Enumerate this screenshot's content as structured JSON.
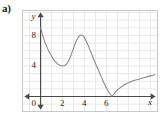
{
  "figure": {
    "part_label": "a)",
    "axis_names": {
      "x": "x",
      "y": "y"
    },
    "origin_label": "0"
  },
  "colors": {
    "grid": "#e9e9e9",
    "axis": "#4a4a4a",
    "curve": "#8a8a8a",
    "frame": "#c9c9c9",
    "text": "#2a2a2a"
  },
  "chart_data": {
    "type": "line",
    "title": "",
    "xlabel": "x",
    "ylabel": "y",
    "xlim": [
      -1.6,
      10.6
    ],
    "ylim": [
      -1.9,
      11.2
    ],
    "grid": true,
    "legend": null,
    "xticks": [
      2,
      4,
      6
    ],
    "xtick_labels": [
      "2",
      "4",
      "6"
    ],
    "yticks": [
      4,
      8
    ],
    "ytick_labels": [
      "4",
      "8"
    ],
    "origin_label": "0",
    "series": [
      {
        "name": "curve",
        "x": [
          0.0,
          0.2,
          0.4,
          0.6,
          0.8,
          1.0,
          1.2,
          1.4,
          1.6,
          1.8,
          2.0,
          2.2,
          2.4,
          2.6,
          2.8,
          3.0,
          3.2,
          3.4,
          3.6,
          3.7,
          3.9,
          4.1,
          4.3,
          4.5,
          4.8,
          5.1,
          5.4,
          5.7,
          6.0,
          6.2,
          6.4,
          6.5,
          6.7,
          6.9,
          7.2,
          7.6,
          8.0,
          8.5,
          9.0,
          9.5,
          10.0,
          10.4
        ],
        "y": [
          9.0,
          8.0,
          7.1,
          6.4,
          5.8,
          5.3,
          4.8,
          4.5,
          4.2,
          4.05,
          4.0,
          4.05,
          4.3,
          4.8,
          5.5,
          6.3,
          7.1,
          7.7,
          8.0,
          8.05,
          7.9,
          7.4,
          6.8,
          6.1,
          5.0,
          4.0,
          3.0,
          2.0,
          1.1,
          0.6,
          0.2,
          0.05,
          0.35,
          0.7,
          1.1,
          1.5,
          1.8,
          2.1,
          2.3,
          2.5,
          2.7,
          2.85
        ]
      }
    ],
    "annotations": {
      "y_intercept": 9.0,
      "local_min": {
        "x": 2.0,
        "y": 4.0
      },
      "local_max": {
        "x": 3.7,
        "y": 8.0
      },
      "x_touch": {
        "x": 6.5,
        "y": 0.0
      }
    }
  }
}
